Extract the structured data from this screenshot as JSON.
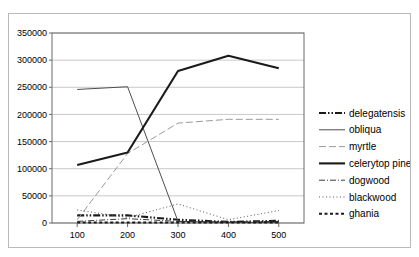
{
  "chart_data": {
    "type": "line",
    "title": "",
    "xlabel": "",
    "ylabel": "",
    "x": [
      100,
      200,
      300,
      400,
      500
    ],
    "xticklabels": [
      "100",
      "200",
      "300",
      "400",
      "500"
    ],
    "yticks": [
      0,
      50000,
      100000,
      150000,
      200000,
      250000,
      300000,
      350000
    ],
    "yticklabels": [
      "0",
      "50000",
      "100000",
      "150000",
      "200000",
      "250000",
      "300000",
      "350000"
    ],
    "ylim": [
      0,
      350000
    ],
    "grid": "horizontal",
    "legend_position": "right",
    "series": [
      {
        "name": "delegatensis",
        "values": [
          14000,
          14000,
          6000,
          2000,
          4000
        ],
        "style": "dash-dot-dot",
        "width": "thick",
        "color": "#1a1a1a"
      },
      {
        "name": "obliqua",
        "values": [
          246000,
          251000,
          3000,
          1000,
          1000
        ],
        "style": "solid",
        "width": "thin",
        "color": "#4d4d4d"
      },
      {
        "name": "myrtle",
        "values": [
          6000,
          128000,
          184000,
          191000,
          191000
        ],
        "style": "long-dash",
        "width": "thin",
        "color": "#9a9a9a"
      },
      {
        "name": "celerytop pine",
        "values": [
          107000,
          130000,
          280000,
          308000,
          285000
        ],
        "style": "solid",
        "width": "thick",
        "color": "#1a1a1a"
      },
      {
        "name": "dogwood",
        "values": [
          3000,
          8000,
          3000,
          2000,
          3000
        ],
        "style": "dash-dot",
        "width": "thin",
        "color": "#3a3a3a"
      },
      {
        "name": "blackwood",
        "values": [
          24000,
          10000,
          35000,
          6000,
          23000
        ],
        "style": "dotted",
        "width": "thin",
        "color": "#555555"
      },
      {
        "name": "ghania",
        "values": [
          1000,
          1000,
          1000,
          1000,
          1000
        ],
        "style": "thick-dotted",
        "width": "thick",
        "color": "#1a1a1a"
      }
    ]
  },
  "legend": {
    "items": [
      {
        "label": "delegatensis"
      },
      {
        "label": "obliqua"
      },
      {
        "label": "myrtle"
      },
      {
        "label": "celerytop pine"
      },
      {
        "label": "dogwood"
      },
      {
        "label": "blackwood"
      },
      {
        "label": "ghania"
      }
    ]
  },
  "colors": {
    "plot_border": "#6b6b6b",
    "frame_border": "#b9b9b9",
    "gridline": "#c9c9c9",
    "axis_text": "#000000",
    "background": "#ffffff"
  }
}
